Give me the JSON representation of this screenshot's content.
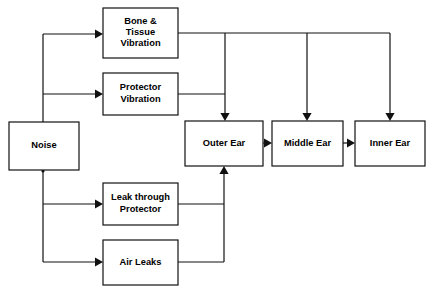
{
  "diagram": {
    "type": "flowchart",
    "background_color": "#ffffff",
    "line_color": "#111111",
    "text_color": "#000000",
    "nodes": [
      {
        "id": "noise",
        "label": "Noise",
        "lines": [
          "Noise"
        ],
        "x": 9,
        "y": 122,
        "width": 70,
        "height": 48
      },
      {
        "id": "bone-tissue-vibration",
        "label": "Bone & Tissue Vibration",
        "lines": [
          "Bone &",
          "Tissue",
          "Vibration"
        ],
        "x": 103,
        "y": 8,
        "width": 75,
        "height": 50
      },
      {
        "id": "protector-vibration",
        "label": "Protector Vibration",
        "lines": [
          "Protector",
          "Vibration"
        ],
        "x": 103,
        "y": 73,
        "width": 75,
        "height": 42
      },
      {
        "id": "leak-through-protector",
        "label": "Leak through Protector",
        "lines": [
          "Leak through",
          "Protector"
        ],
        "x": 103,
        "y": 183,
        "width": 75,
        "height": 42
      },
      {
        "id": "air-leaks",
        "label": "Air Leaks",
        "lines": [
          "Air Leaks"
        ],
        "x": 103,
        "y": 240,
        "width": 75,
        "height": 45
      },
      {
        "id": "outer-ear",
        "label": "Outer Ear",
        "lines": [
          "Outer Ear"
        ],
        "x": 185,
        "y": 121,
        "width": 78,
        "height": 45
      },
      {
        "id": "middle-ear",
        "label": "Middle Ear",
        "lines": [
          "Middle Ear"
        ],
        "x": 272,
        "y": 121,
        "width": 71,
        "height": 45
      },
      {
        "id": "inner-ear",
        "label": "Inner Ear",
        "lines": [
          "Inner Ear"
        ],
        "x": 355,
        "y": 121,
        "width": 70,
        "height": 45
      }
    ],
    "edges": [
      {
        "id": "noise-trunk-up",
        "from": "noise",
        "to": "vertical-trunk-upper",
        "points": "43,122 43,34",
        "arrow": false
      },
      {
        "id": "noise-trunk-down",
        "from": "noise",
        "to": "vertical-trunk-lower",
        "points": "43,170 43,262",
        "arrow": false
      },
      {
        "id": "noise-to-bone-tissue-vibration",
        "from": "noise",
        "to": "bone-tissue-vibration",
        "points": "43,34 103,34",
        "arrow": true,
        "arrow_dir": "right",
        "arrow_x": 103,
        "arrow_y": 34
      },
      {
        "id": "noise-to-protector-vibration",
        "from": "noise",
        "to": "protector-vibration",
        "points": "43,94 103,94",
        "arrow": true,
        "arrow_dir": "right",
        "arrow_x": 103,
        "arrow_y": 94
      },
      {
        "id": "noise-to-leak-through-protector",
        "from": "noise",
        "to": "leak-through-protector",
        "points": "43,204 103,204",
        "arrow": true,
        "arrow_dir": "right",
        "arrow_x": 103,
        "arrow_y": 204
      },
      {
        "id": "noise-to-air-leaks",
        "from": "noise",
        "to": "air-leaks",
        "points": "43,262 103,262",
        "arrow": true,
        "arrow_dir": "right",
        "arrow_x": 103,
        "arrow_y": 262
      },
      {
        "id": "bone-tissue-vibration-bus",
        "from": "bone-tissue-vibration",
        "to": "distribution-bus",
        "points": "178,33 390,33",
        "arrow": false
      },
      {
        "id": "bus-to-outer-ear",
        "from": "bone-tissue-vibration",
        "to": "outer-ear",
        "points": "225,33 225,121",
        "arrow": true,
        "arrow_dir": "down",
        "arrow_x": 225,
        "arrow_y": 121
      },
      {
        "id": "bus-to-middle-ear",
        "from": "bone-tissue-vibration",
        "to": "middle-ear",
        "points": "307,33 307,121",
        "arrow": true,
        "arrow_dir": "down",
        "arrow_x": 307,
        "arrow_y": 121
      },
      {
        "id": "bus-to-inner-ear",
        "from": "bone-tissue-vibration",
        "to": "inner-ear",
        "points": "390,33 390,121",
        "arrow": true,
        "arrow_dir": "down",
        "arrow_x": 390,
        "arrow_y": 121
      },
      {
        "id": "protector-vibration-to-outer-ear",
        "from": "protector-vibration",
        "to": "outer-ear",
        "points": "178,94 225,94",
        "arrow": false
      },
      {
        "id": "leak-through-protector-to-riser",
        "from": "leak-through-protector",
        "to": "outer-ear",
        "points": "178,204 224,204",
        "arrow": false
      },
      {
        "id": "air-leaks-to-riser",
        "from": "air-leaks",
        "to": "outer-ear",
        "points": "178,262 224,262",
        "arrow": false
      },
      {
        "id": "riser-to-outer-ear",
        "from": "air-leaks",
        "to": "outer-ear",
        "points": "224,262 224,166",
        "arrow": true,
        "arrow_dir": "up",
        "arrow_x": 224,
        "arrow_y": 166
      },
      {
        "id": "outer-ear-to-middle-ear",
        "from": "outer-ear",
        "to": "middle-ear",
        "points": "263,143 272,143",
        "arrow": true,
        "arrow_dir": "right",
        "arrow_x": 272,
        "arrow_y": 143
      },
      {
        "id": "middle-ear-to-inner-ear",
        "from": "middle-ear",
        "to": "inner-ear",
        "points": "343,143 355,143",
        "arrow": true,
        "arrow_dir": "right",
        "arrow_x": 355,
        "arrow_y": 143
      }
    ],
    "junctions": [
      {
        "id": "noise-trunk-junction",
        "x": 43,
        "y": 171
      }
    ]
  }
}
